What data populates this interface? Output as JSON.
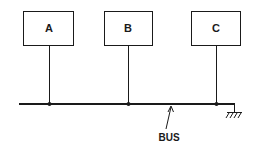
{
  "diagram": {
    "nodes": [
      {
        "id": "A",
        "label": "A"
      },
      {
        "id": "B",
        "label": "B"
      },
      {
        "id": "C",
        "label": "C"
      }
    ],
    "bus": {
      "label": "BUS"
    },
    "ground": {
      "symbol": "ground-icon"
    },
    "colors": {
      "stroke": "#1a1a1a",
      "background": "#ffffff"
    }
  }
}
